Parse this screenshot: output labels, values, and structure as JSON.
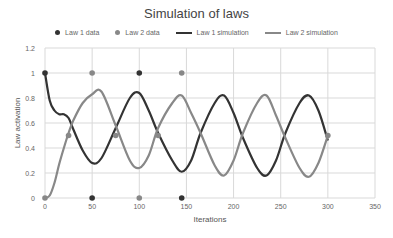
{
  "chart_data": {
    "type": "line",
    "title": "Simulation of laws",
    "xlabel": "Iterations",
    "ylabel": "Law activation",
    "xlim": [
      0,
      350
    ],
    "ylim": [
      0,
      1.2
    ],
    "xticks": [
      0,
      50,
      100,
      150,
      200,
      250,
      300,
      350
    ],
    "yticks": [
      0,
      0.2,
      0.4,
      0.6,
      0.8,
      1,
      1.2
    ],
    "grid": true,
    "legend_position": "top",
    "series": [
      {
        "name": "Law 1 data",
        "kind": "scatter",
        "color": "#333333",
        "x": [
          0,
          50,
          100,
          145
        ],
        "y": [
          1,
          0,
          1,
          0
        ]
      },
      {
        "name": "Law 2 data",
        "kind": "scatter",
        "color": "#888888",
        "x": [
          0,
          25,
          50,
          75,
          100,
          120,
          145,
          300
        ],
        "y": [
          0,
          0.5,
          1,
          0.5,
          0,
          0.5,
          1,
          0.5
        ]
      },
      {
        "name": "Law 1 simulation",
        "kind": "line",
        "color": "#333333",
        "x": [
          0,
          5,
          10,
          15,
          20,
          25,
          30,
          40,
          50,
          60,
          75,
          90,
          100,
          110,
          120,
          135,
          145,
          155,
          165,
          180,
          190,
          200,
          210,
          225,
          235,
          245,
          255,
          270,
          280,
          290,
          300
        ],
        "y": [
          1,
          0.78,
          0.7,
          0.67,
          0.67,
          0.64,
          0.55,
          0.38,
          0.28,
          0.32,
          0.56,
          0.8,
          0.84,
          0.7,
          0.52,
          0.3,
          0.21,
          0.3,
          0.52,
          0.76,
          0.82,
          0.68,
          0.48,
          0.24,
          0.18,
          0.3,
          0.52,
          0.76,
          0.82,
          0.7,
          0.46
        ]
      },
      {
        "name": "Law 2 simulation",
        "kind": "line",
        "color": "#888888",
        "x": [
          0,
          5,
          10,
          15,
          20,
          25,
          30,
          40,
          50,
          60,
          75,
          90,
          100,
          110,
          120,
          135,
          145,
          155,
          165,
          180,
          190,
          200,
          210,
          225,
          235,
          245,
          255,
          270,
          280,
          290,
          300
        ],
        "y": [
          0,
          0.02,
          0.12,
          0.27,
          0.4,
          0.52,
          0.62,
          0.76,
          0.83,
          0.85,
          0.58,
          0.3,
          0.24,
          0.34,
          0.56,
          0.76,
          0.82,
          0.68,
          0.52,
          0.26,
          0.18,
          0.3,
          0.52,
          0.76,
          0.82,
          0.66,
          0.48,
          0.24,
          0.17,
          0.28,
          0.5
        ]
      }
    ]
  }
}
